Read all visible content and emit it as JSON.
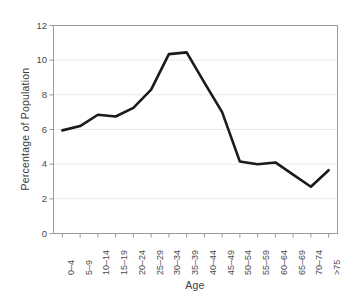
{
  "chart_data": {
    "type": "line",
    "title": "",
    "xlabel": "Age",
    "ylabel": "Percentage of Population",
    "categories": [
      "0–4",
      "5–9",
      "10–14",
      "15–19",
      "20–24",
      "25–29",
      "30–34",
      "35–39",
      "40–44",
      "45–49",
      "50–54",
      "55–59",
      "60–64",
      "65–69",
      "70–74",
      ">75"
    ],
    "values": [
      5.95,
      6.2,
      6.85,
      6.75,
      7.25,
      8.3,
      10.35,
      10.45,
      8.7,
      7.0,
      4.15,
      4.0,
      4.1,
      3.4,
      2.7,
      3.65
    ],
    "ylim": [
      0,
      12
    ],
    "yticks": [
      0,
      2,
      4,
      6,
      8,
      10,
      12
    ],
    "ytick_labels": [
      "0",
      "2",
      "4",
      "6",
      "8",
      "10",
      "12"
    ],
    "grid": "horizontal",
    "legend": "none",
    "series_color": "#1a1a1a",
    "grid_color": "#e8e8e8",
    "axis_color": "#9a9a9a"
  }
}
